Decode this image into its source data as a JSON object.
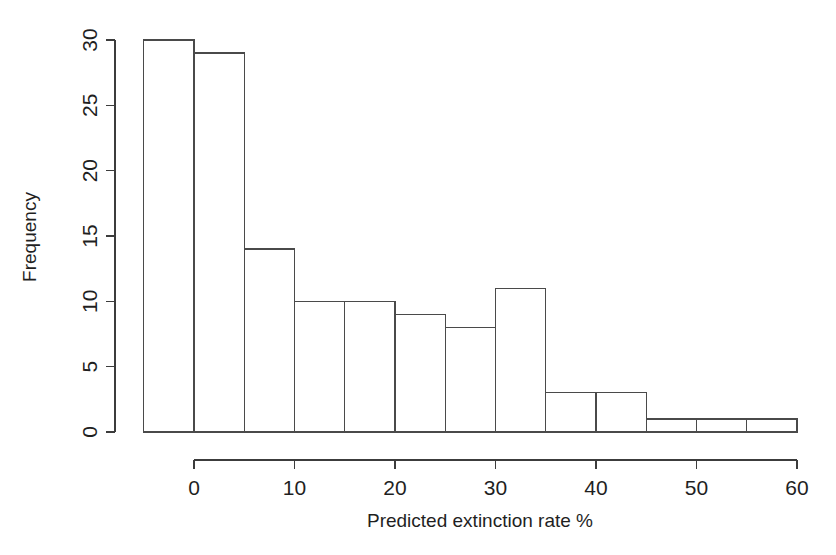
{
  "figure": {
    "background_color": "#ffffff",
    "line_color": "#3c3c3c",
    "bar_fill_color": "#ffffff",
    "bar_stroke_color": "#4a4a4a"
  },
  "chart_data": {
    "type": "bar",
    "title": "",
    "subtitle": "",
    "xlabel": "Predicted extinction rate %",
    "ylabel": "Frequency",
    "xlim": [
      -5,
      60
    ],
    "ylim": [
      0,
      30
    ],
    "grid": false,
    "legend": false,
    "legend_position": "none",
    "bin_width": 5,
    "x_tick_labels": [
      "0",
      "10",
      "20",
      "30",
      "40",
      "50",
      "60"
    ],
    "x_tick_values": [
      0,
      10,
      20,
      30,
      40,
      50,
      60
    ],
    "x_minor_tick_values": [
      -5,
      5,
      15,
      25,
      35,
      45,
      55
    ],
    "y_tick_labels": [
      "0",
      "5",
      "10",
      "15",
      "20",
      "25",
      "30"
    ],
    "y_tick_values": [
      0,
      5,
      10,
      15,
      20,
      25,
      30
    ],
    "categories": [
      "-5 to 0",
      "0 to 5",
      "5 to 10",
      "10 to 15",
      "15 to 20",
      "20 to 25",
      "25 to 30",
      "30 to 35",
      "35 to 40",
      "40 to 45",
      "45 to 50",
      "50 to 55",
      "55 to 60"
    ],
    "bin_edges": [
      -5,
      0,
      5,
      10,
      15,
      20,
      25,
      30,
      35,
      40,
      45,
      50,
      55,
      60
    ],
    "values": [
      30,
      29,
      14,
      10,
      10,
      9,
      8,
      11,
      3,
      3,
      1,
      1,
      1
    ],
    "annotations": []
  }
}
